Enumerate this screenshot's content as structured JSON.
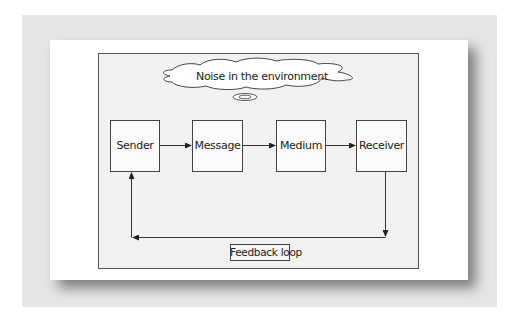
{
  "diagram": {
    "cloud_label": "Noise in the environment",
    "nodes": [
      {
        "id": "sender",
        "label": "Sender"
      },
      {
        "id": "message",
        "label": "Message"
      },
      {
        "id": "medium",
        "label": "Medium"
      },
      {
        "id": "receiver",
        "label": "Receiver"
      }
    ],
    "edges": [
      {
        "from": "sender",
        "to": "message"
      },
      {
        "from": "message",
        "to": "medium"
      },
      {
        "from": "medium",
        "to": "receiver"
      },
      {
        "from": "receiver",
        "to": "sender",
        "label": "Feedback loop"
      }
    ],
    "feedback_label": "Feedback loop"
  },
  "colors": {
    "frame": "#e6e6e6",
    "card": "#ffffff",
    "panel": "#f1f1f1",
    "stroke": "#333333"
  }
}
